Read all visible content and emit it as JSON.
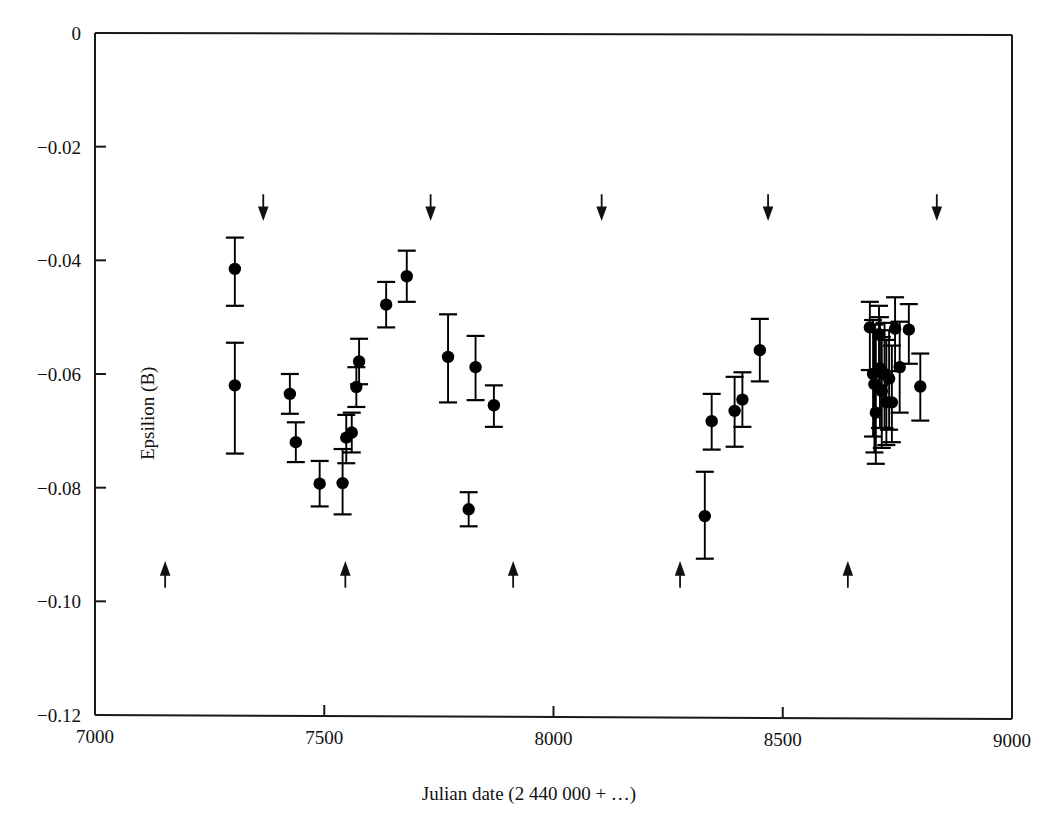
{
  "chart_data": {
    "type": "scatter",
    "title": "",
    "xlabel": "Julian date (2 440 000 + …)",
    "ylabel": "Epsilion (B)",
    "xlim": [
      7000,
      9000
    ],
    "ylim": [
      -0.12,
      0.0
    ],
    "xticks": [
      7000,
      7500,
      8000,
      8500,
      9000
    ],
    "xtick_labels": [
      "7000",
      "7500",
      "8000",
      "8500",
      "9000"
    ],
    "yticks": [
      0.0,
      -0.02,
      -0.04,
      -0.06,
      -0.08,
      -0.1,
      -0.12
    ],
    "ytick_labels": [
      "0",
      "−0.02",
      "−0.04",
      "−0.06",
      "−0.08",
      "−0.10",
      "−0.12"
    ],
    "grid": false,
    "legend": null,
    "marker": "filled-circle",
    "marker_color": "#000000",
    "errorbar_color": "#000000",
    "frame_color": "#1a1a1a",
    "points": [
      {
        "x": 7305,
        "y": -0.0415,
        "yerr_lo": 0.0065,
        "yerr_hi": 0.0055
      },
      {
        "x": 7305,
        "y": -0.062,
        "yerr_lo": 0.012,
        "yerr_hi": 0.0075
      },
      {
        "x": 7425,
        "y": -0.0635,
        "yerr_lo": 0.0035,
        "yerr_hi": 0.0035
      },
      {
        "x": 7438,
        "y": -0.072,
        "yerr_lo": 0.0035,
        "yerr_hi": 0.0035
      },
      {
        "x": 7490,
        "y": -0.0793,
        "yerr_lo": 0.004,
        "yerr_hi": 0.004
      },
      {
        "x": 7540,
        "y": -0.0792,
        "yerr_lo": 0.0055,
        "yerr_hi": 0.006
      },
      {
        "x": 7548,
        "y": -0.0712,
        "yerr_lo": 0.0045,
        "yerr_hi": 0.004
      },
      {
        "x": 7560,
        "y": -0.0703,
        "yerr_lo": 0.0035,
        "yerr_hi": 0.0035
      },
      {
        "x": 7570,
        "y": -0.0623,
        "yerr_lo": 0.0035,
        "yerr_hi": 0.0035
      },
      {
        "x": 7576,
        "y": -0.0578,
        "yerr_lo": 0.004,
        "yerr_hi": 0.004
      },
      {
        "x": 7635,
        "y": -0.0478,
        "yerr_lo": 0.004,
        "yerr_hi": 0.004
      },
      {
        "x": 7680,
        "y": -0.0428,
        "yerr_lo": 0.0045,
        "yerr_hi": 0.0045
      },
      {
        "x": 7770,
        "y": -0.057,
        "yerr_lo": 0.008,
        "yerr_hi": 0.0075
      },
      {
        "x": 7830,
        "y": -0.0588,
        "yerr_lo": 0.0058,
        "yerr_hi": 0.0055
      },
      {
        "x": 7870,
        "y": -0.0655,
        "yerr_lo": 0.0038,
        "yerr_hi": 0.0035
      },
      {
        "x": 7815,
        "y": -0.0838,
        "yerr_lo": 0.003,
        "yerr_hi": 0.003
      },
      {
        "x": 8330,
        "y": -0.085,
        "yerr_lo": 0.0075,
        "yerr_hi": 0.0078
      },
      {
        "x": 8345,
        "y": -0.0683,
        "yerr_lo": 0.005,
        "yerr_hi": 0.0048
      },
      {
        "x": 8395,
        "y": -0.0665,
        "yerr_lo": 0.0063,
        "yerr_hi": 0.006
      },
      {
        "x": 8412,
        "y": -0.0645,
        "yerr_lo": 0.0048,
        "yerr_hi": 0.0048
      },
      {
        "x": 8450,
        "y": -0.0558,
        "yerr_lo": 0.0055,
        "yerr_hi": 0.0055
      },
      {
        "x": 8690,
        "y": -0.0518,
        "yerr_lo": 0.0075,
        "yerr_hi": 0.0045
      },
      {
        "x": 8697,
        "y": -0.06,
        "yerr_lo": 0.011,
        "yerr_hi": 0.0095
      },
      {
        "x": 8700,
        "y": -0.0618,
        "yerr_lo": 0.012,
        "yerr_hi": 0.0105
      },
      {
        "x": 8703,
        "y": -0.0668,
        "yerr_lo": 0.009,
        "yerr_hi": 0.0145
      },
      {
        "x": 8710,
        "y": -0.053,
        "yerr_lo": 0.009,
        "yerr_hi": 0.005
      },
      {
        "x": 8712,
        "y": -0.059,
        "yerr_lo": 0.0105,
        "yerr_hi": 0.009
      },
      {
        "x": 8716,
        "y": -0.063,
        "yerr_lo": 0.01,
        "yerr_hi": 0.0095
      },
      {
        "x": 8722,
        "y": -0.06,
        "yerr_lo": 0.0095,
        "yerr_hi": 0.009
      },
      {
        "x": 8726,
        "y": -0.065,
        "yerr_lo": 0.0075,
        "yerr_hi": 0.011
      },
      {
        "x": 8732,
        "y": -0.0608,
        "yerr_lo": 0.009,
        "yerr_hi": 0.0085
      },
      {
        "x": 8738,
        "y": -0.065,
        "yerr_lo": 0.007,
        "yerr_hi": 0.01
      },
      {
        "x": 8745,
        "y": -0.052,
        "yerr_lo": 0.0075,
        "yerr_hi": 0.0055
      },
      {
        "x": 8755,
        "y": -0.0588,
        "yerr_lo": 0.008,
        "yerr_hi": 0.008
      },
      {
        "x": 8775,
        "y": -0.0522,
        "yerr_lo": 0.006,
        "yerr_hi": 0.0045
      },
      {
        "x": 8800,
        "y": -0.0622,
        "yerr_lo": 0.006,
        "yerr_hi": 0.0058
      }
    ],
    "arrows_down": [
      {
        "x": 7367,
        "y": -0.0305
      },
      {
        "x": 7732,
        "y": -0.0305
      },
      {
        "x": 8105,
        "y": -0.0305
      },
      {
        "x": 8468,
        "y": -0.0305
      },
      {
        "x": 8836,
        "y": -0.0305
      }
    ],
    "arrows_up": [
      {
        "x": 7153,
        "y": -0.0955
      },
      {
        "x": 7546,
        "y": -0.0955
      },
      {
        "x": 7912,
        "y": -0.0955
      },
      {
        "x": 8276,
        "y": -0.0955
      },
      {
        "x": 8642,
        "y": -0.0955
      }
    ]
  }
}
